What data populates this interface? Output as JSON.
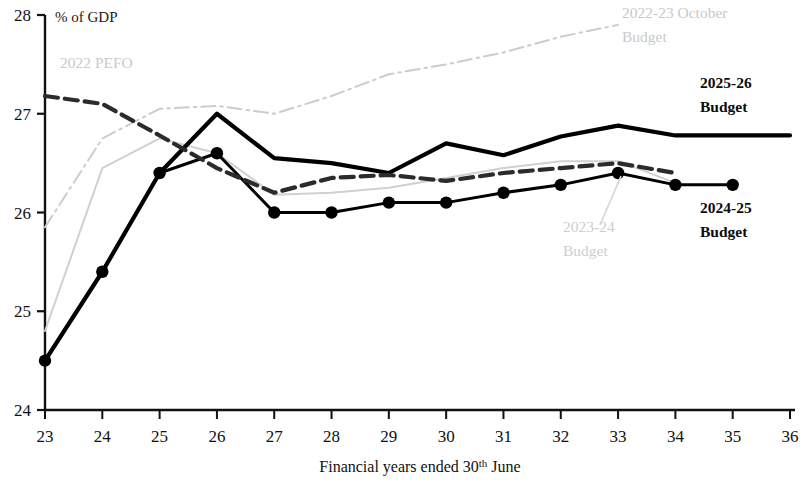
{
  "chart_data": {
    "type": "line",
    "title": "",
    "xlabel": "Financial years ended 30th June",
    "ylabel": "% of GDP",
    "ylim": [
      24,
      28
    ],
    "xlim": [
      23,
      36
    ],
    "yticks": [
      24,
      25,
      26,
      27,
      28
    ],
    "xticks": [
      23,
      24,
      25,
      26,
      27,
      28,
      29,
      30,
      31,
      32,
      33,
      34,
      35,
      36
    ],
    "grid": false,
    "legend_position": "inline-annotations",
    "series": [
      {
        "name": "2025-26 Budget",
        "style": "solid-thick-black",
        "color": "#000000",
        "x": [
          23,
          24,
          25,
          26,
          27,
          28,
          29,
          30,
          31,
          32,
          33,
          34,
          35,
          36
        ],
        "values": [
          24.5,
          25.4,
          26.4,
          27.0,
          26.55,
          26.5,
          26.4,
          26.7,
          26.58,
          26.77,
          26.88,
          26.78,
          26.78,
          26.78
        ]
      },
      {
        "name": "2024-25 Budget",
        "style": "solid-black-markers",
        "color": "#000000",
        "x": [
          23,
          24,
          25,
          26,
          27,
          28,
          29,
          30,
          31,
          32,
          33,
          34,
          35
        ],
        "values": [
          24.5,
          25.4,
          26.4,
          26.6,
          26.0,
          26.0,
          26.1,
          26.1,
          26.2,
          26.28,
          26.4,
          26.28,
          26.28
        ]
      },
      {
        "name": "2022 PEFO",
        "style": "dashed-thick-darkgrey",
        "color": "#2b2b2b",
        "x": [
          23,
          24,
          25,
          26,
          27,
          28,
          29,
          30,
          31,
          32,
          33,
          34
        ],
        "values": [
          27.18,
          27.1,
          26.78,
          26.45,
          26.2,
          26.35,
          26.38,
          26.32,
          26.4,
          26.45,
          26.5,
          26.4
        ]
      },
      {
        "name": "2023-24 Budget",
        "style": "solid-thin-lightgrey",
        "color": "#d0d0d0",
        "x": [
          23,
          24,
          25,
          26,
          27,
          28,
          29,
          30,
          31,
          32,
          33,
          34
        ],
        "values": [
          24.8,
          26.45,
          26.75,
          26.6,
          26.18,
          26.2,
          26.25,
          26.35,
          26.45,
          26.52,
          26.52,
          26.3
        ]
      },
      {
        "name": "2022-23 October Budget",
        "style": "dashdot-lightgrey",
        "color": "#cccccc",
        "x": [
          23,
          24,
          25,
          26,
          27,
          28,
          29,
          30,
          31,
          32,
          33
        ],
        "values": [
          25.85,
          26.75,
          27.05,
          27.08,
          27.0,
          27.18,
          27.4,
          27.5,
          27.62,
          27.78,
          27.9
        ]
      }
    ],
    "annotations": [
      {
        "id": "ann-2022-pefo",
        "text": "2022 PEFO",
        "tone": "faint",
        "x": 60,
        "y": 68
      },
      {
        "id": "ann-2022-23-oct-l1",
        "text": "2022-23 October",
        "tone": "faint",
        "x": 622,
        "y": 18
      },
      {
        "id": "ann-2022-23-oct-l2",
        "text": "Budget",
        "tone": "faint",
        "x": 622,
        "y": 42
      },
      {
        "id": "ann-2025-26-l1",
        "text": "2025-26",
        "tone": "dark",
        "x": 700,
        "y": 88
      },
      {
        "id": "ann-2025-26-l2",
        "text": "Budget",
        "tone": "dark",
        "x": 700,
        "y": 112
      },
      {
        "id": "ann-2024-25-l1",
        "text": "2024-25",
        "tone": "dark",
        "x": 700,
        "y": 213
      },
      {
        "id": "ann-2024-25-l2",
        "text": "Budget",
        "tone": "dark",
        "x": 700,
        "y": 237
      },
      {
        "id": "ann-2023-24-l1",
        "text": "2023-24",
        "tone": "faint",
        "x": 563,
        "y": 232
      },
      {
        "id": "ann-2023-24-l2",
        "text": "Budget",
        "tone": "faint",
        "x": 563,
        "y": 256
      }
    ]
  },
  "axis": {
    "y_unit_label": "% of GDP",
    "x_title_main": "Financial years ended 30",
    "x_title_sup": "th",
    "x_title_tail": " June",
    "ytick_labels": [
      "28",
      "27",
      "26",
      "25",
      "24"
    ],
    "xtick_labels": [
      "23",
      "24",
      "25",
      "26",
      "27",
      "28",
      "29",
      "30",
      "31",
      "32",
      "33",
      "34",
      "35",
      "36"
    ]
  },
  "colors": {
    "axis": "#111111",
    "series_2025_26": "#000000",
    "series_2024_25": "#000000",
    "series_2022_pefo": "#2b2b2b",
    "series_2023_24": "#d0d0d0",
    "series_2022_23_oct": "#cccccc"
  }
}
